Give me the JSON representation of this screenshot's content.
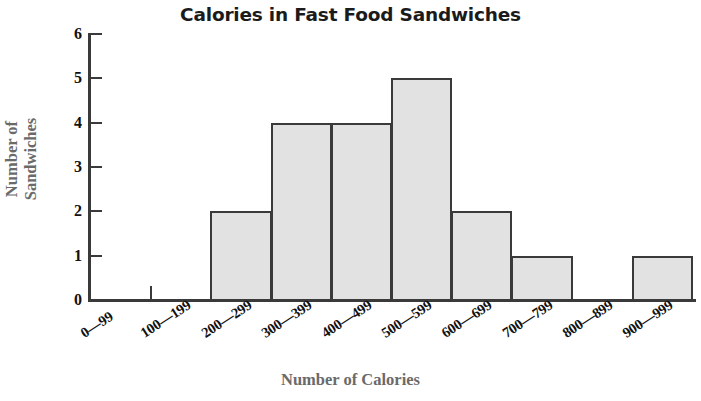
{
  "chart_data": {
    "type": "bar",
    "title": "Calories in Fast Food Sandwiches",
    "xlabel": "Number of Calories",
    "ylabel_line1": "Number of",
    "ylabel_line2": "Sandwiches",
    "ylabel": "Number of Sandwiches",
    "categories": [
      "0—99",
      "100—199",
      "200—299",
      "300—399",
      "400—499",
      "500—599",
      "600—699",
      "700—799",
      "800—899",
      "900—999"
    ],
    "values": [
      0,
      0,
      2,
      4,
      4,
      5,
      2,
      1,
      0,
      1
    ],
    "ylim": [
      0,
      6
    ],
    "ytick_labels": [
      "0",
      "1",
      "2",
      "3",
      "4",
      "5",
      "6"
    ],
    "ytick_values": [
      0,
      1,
      2,
      3,
      4,
      5,
      6
    ],
    "grid": false,
    "legend": false,
    "bar_fill_color": "#e2e2e2",
    "bar_edge_color": "#3a3a3a",
    "axis_color": "#3a3a3a",
    "axis_title_color": "#6a6a6a",
    "tick_label_color": "#111111",
    "title_color": "#1b1b1b",
    "background_color": "#ffffff"
  }
}
